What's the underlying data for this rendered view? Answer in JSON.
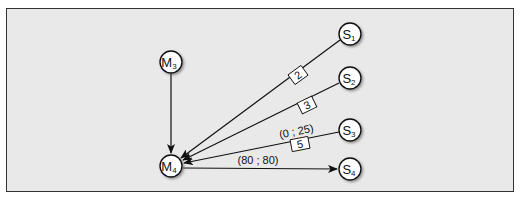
{
  "diagram": {
    "type": "network",
    "nodes": [
      {
        "id": "M3",
        "letter": "M",
        "sub": "3",
        "x": 171,
        "y": 62
      },
      {
        "id": "M4",
        "letter": "M",
        "sub": "4",
        "x": 171,
        "y": 166
      },
      {
        "id": "S1",
        "letter": "S",
        "sub": "1",
        "x": 350,
        "y": 34
      },
      {
        "id": "S2",
        "letter": "S",
        "sub": "2",
        "x": 350,
        "y": 78
      },
      {
        "id": "S3",
        "letter": "S",
        "sub": "3",
        "x": 350,
        "y": 130
      },
      {
        "id": "S4",
        "letter": "S",
        "sub": "4",
        "x": 350,
        "y": 169
      }
    ],
    "edges": [
      {
        "from": "M3",
        "to": "M4",
        "box_label": "",
        "text_label": ""
      },
      {
        "from": "S1",
        "to": "M4",
        "box_label": "2",
        "text_label": ""
      },
      {
        "from": "S2",
        "to": "M4",
        "box_label": "3",
        "text_label": ""
      },
      {
        "from": "S3",
        "to": "M4",
        "box_label": "5",
        "text_label": "(0 ; 25)"
      },
      {
        "from": "M4",
        "to": "S4",
        "box_label": "",
        "text_label": "(80 ; 80)"
      }
    ],
    "labels": {
      "m3_letter": "M",
      "m3_sub": "3",
      "m4_letter": "M",
      "m4_sub": "4",
      "s1_letter": "S",
      "s1_sub": "1",
      "s2_letter": "S",
      "s2_sub": "2",
      "s3_letter": "S",
      "s3_sub": "3",
      "s4_letter": "S",
      "s4_sub": "4",
      "edge_s1_box": "2",
      "edge_s2_box": "3",
      "edge_s3_box": "5",
      "edge_s3_text": "(0 ; 25)",
      "edge_s4_text": "(80 ; 80)"
    },
    "colors": {
      "background": "#e9e9e9",
      "stroke": "#111111",
      "node_fill": "#ffffff"
    }
  }
}
